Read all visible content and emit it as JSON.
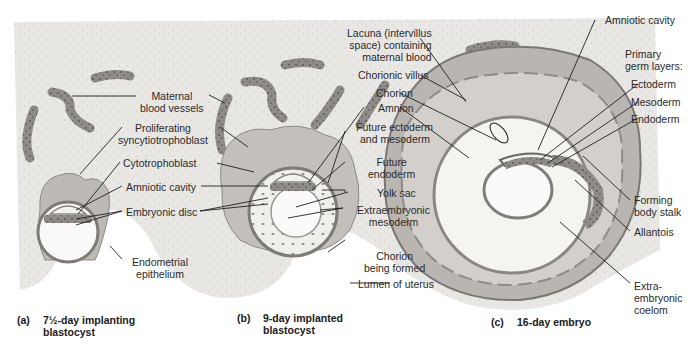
{
  "figure": {
    "colors": {
      "tissue_background": "#e8e6e3",
      "blood_vessel": "#8a8785",
      "trophoblast": "#b9b6b2",
      "leader_line": "#1f1f1f",
      "label_text": "#2a2a2a"
    }
  },
  "panels": [
    {
      "id": "a",
      "tag": "(a)",
      "caption_line1": "7½-day implanting",
      "caption_line2": "blastocyst"
    },
    {
      "id": "b",
      "tag": "(b)",
      "caption_line1": "9-day implanted",
      "caption_line2": "blastocyst"
    },
    {
      "id": "c",
      "tag": "(c)",
      "caption_line1": "16-day embryo",
      "caption_line2": ""
    }
  ],
  "labels": {
    "maternal_blood_vessels_1": "Maternal",
    "maternal_blood_vessels_2": "blood vessels",
    "proliferating_syncytiotrophoblast_1": "Proliferating",
    "proliferating_syncytiotrophoblast_2": "syncytiotrophoblast",
    "cytotrophoblast": "Cytotrophoblast",
    "amniotic_cavity_a": "Amniotic cavity",
    "embryonic_disc": "Embryonic disc",
    "endometrial_epithelium_1": "Endometrial",
    "endometrial_epithelium_2": "epithelium",
    "lacuna_1": "Lacuna (intervillus",
    "lacuna_2": "space) containing",
    "lacuna_3": "maternal blood",
    "chorionic_villus": "Chorionic villus",
    "chorion": "Chorion",
    "amnion": "Amnion",
    "future_ectoderm_1": "Future ectoderm",
    "future_ectoderm_2": "and mesoderm",
    "future_endoderm_1": "Future",
    "future_endoderm_2": "endoderm",
    "yolk_sac": "Yolk sac",
    "extraembryonic_mesoderm_1": "Extraembryonic",
    "extraembryonic_mesoderm_2": "mesoderm",
    "chorion_being_formed_1": "Chorion",
    "chorion_being_formed_2": "being formed",
    "lumen_of_uterus": "Lumen of uterus",
    "amniotic_cavity_c": "Amniotic cavity",
    "primary_germ_layers_1": "Primary",
    "primary_germ_layers_2": "germ layers:",
    "ectoderm": "Ectoderm",
    "mesoderm": "Mesoderm",
    "endoderm": "Endoderm",
    "forming_body_stalk_1": "Forming",
    "forming_body_stalk_2": "body stalk",
    "allantois": "Allantois",
    "extraembryonic_coelom_1": "Extra-",
    "extraembryonic_coelom_2": "embryonic",
    "extraembryonic_coelom_3": "coelom"
  }
}
